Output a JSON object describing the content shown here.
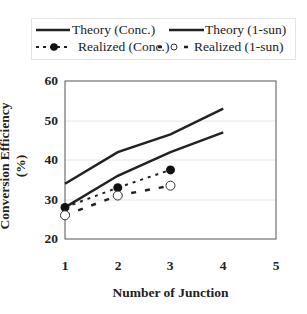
{
  "chart_data": {
    "type": "line",
    "title": "",
    "xlabel": "Number of Junction",
    "ylabel": "Conversion Efficiency (%)",
    "x": [
      1,
      2,
      3,
      4
    ],
    "xticks": [
      "1",
      "2",
      "3",
      "4",
      "5"
    ],
    "yticks": [
      "20",
      "30",
      "40",
      "50",
      "60"
    ],
    "xlim": [
      1,
      5
    ],
    "ylim": [
      20,
      60
    ],
    "grid": "horizontal",
    "legend_position": "top",
    "series": [
      {
        "name": "Theory (Conc.)",
        "style": "solid",
        "marker": "none",
        "x": [
          1,
          2,
          3,
          4
        ],
        "values": [
          34,
          42,
          46.5,
          53
        ]
      },
      {
        "name": "Theory (1-sun)",
        "style": "solid",
        "marker": "none",
        "x": [
          1,
          2,
          3,
          4
        ],
        "values": [
          28,
          36,
          42,
          47
        ]
      },
      {
        "name": "Realized (Conc.)",
        "style": "dotted",
        "marker": "filled-circle",
        "x": [
          1,
          2,
          3
        ],
        "values": [
          28,
          33,
          37.5
        ]
      },
      {
        "name": "Realized (1-sun)",
        "style": "dashed",
        "marker": "open-circle",
        "x": [
          1,
          2,
          3
        ],
        "values": [
          26,
          31,
          33.5
        ]
      }
    ]
  },
  "legend": {
    "items": [
      "Theory (Conc.)",
      "Theory (1-sun)",
      "Realized (Conc.)",
      "Realized (1-sun)"
    ]
  }
}
